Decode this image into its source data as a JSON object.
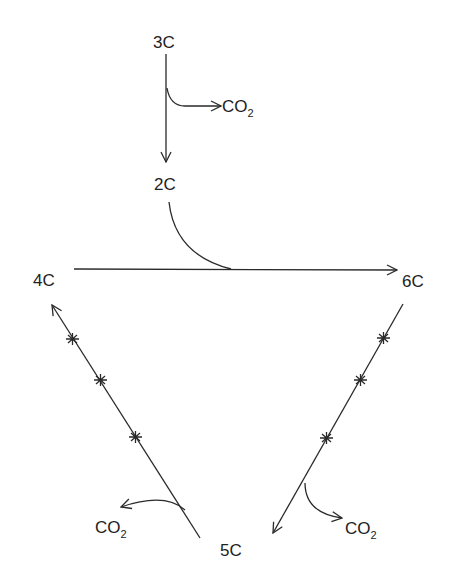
{
  "diagram": {
    "nodes": {
      "c3": "3C",
      "c2": "2C",
      "c4": "4C",
      "c6": "6C",
      "c5": "5C"
    },
    "co2": {
      "main": "CO",
      "subscript": "2"
    },
    "edges": [
      {
        "from": "3C",
        "to": "2C",
        "releases": "CO2"
      },
      {
        "from": "4C",
        "to": "6C",
        "joins": "2C"
      },
      {
        "from": "6C",
        "to": "5C",
        "releases": "CO2",
        "marked_steps": 3
      },
      {
        "from": "5C",
        "to": "4C",
        "releases": "CO2",
        "marked_steps": 3
      }
    ]
  }
}
